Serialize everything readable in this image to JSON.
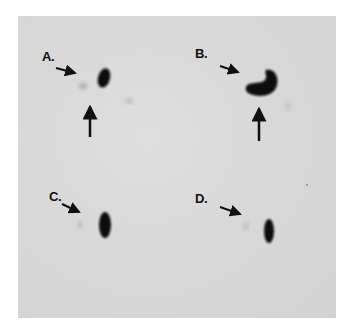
{
  "figure": {
    "panels": [
      {
        "label": "A."
      },
      {
        "label": "B."
      },
      {
        "label": "C."
      },
      {
        "label": "D."
      }
    ],
    "colors": {
      "background": "#d9d9d9",
      "spot": "#0c0c0c",
      "arrow": "#111111"
    }
  }
}
